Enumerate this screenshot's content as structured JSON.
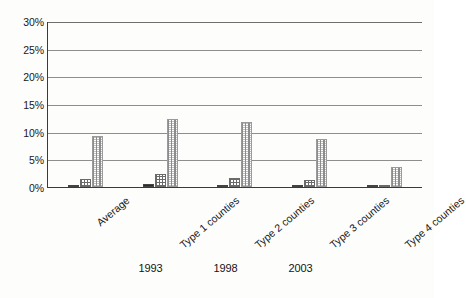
{
  "chart_data": {
    "type": "bar",
    "title": "",
    "subtitle": "",
    "xlabel": "",
    "ylabel": "",
    "ylim": [
      0,
      30
    ],
    "ytick_labels": [
      "30%",
      "25%",
      "20%",
      "15%",
      "10%",
      "5%",
      "0%"
    ],
    "ytick_values": [
      30,
      25,
      20,
      15,
      10,
      5,
      0
    ],
    "grid": true,
    "legend_position": "bottom",
    "categories": [
      "Average",
      "Type 1 counties",
      "Type 2 counties",
      "Type 3 counties",
      "Type 4 counties"
    ],
    "series": [
      {
        "name": "1993",
        "pattern": "dense-checkerboard",
        "color": "#2b2b2b",
        "values": [
          0.3,
          0.5,
          0.2,
          0.4,
          0.2
        ]
      },
      {
        "name": "1998",
        "pattern": "crosshatch",
        "color": "#6b6b6b",
        "values": [
          1.5,
          2.3,
          1.6,
          1.2,
          0.3
        ]
      },
      {
        "name": "2003",
        "pattern": "fine-dotted",
        "color": "#8c8c8c",
        "values": [
          9.3,
          12.3,
          11.8,
          8.7,
          3.7
        ]
      }
    ]
  },
  "legend": {
    "items": [
      {
        "label": "1993",
        "swatch": "checkerboard-swatch"
      },
      {
        "label": "1998",
        "swatch": "crosshatch-swatch"
      },
      {
        "label": "2003",
        "swatch": "dotted-swatch"
      }
    ]
  }
}
